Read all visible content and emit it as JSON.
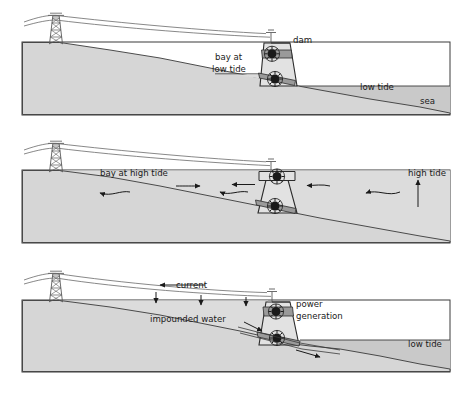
{
  "diagram": {
    "colors": {
      "land": "#d6d6d6",
      "water": "#c9c9c9",
      "bay_water": "#dcdcdc",
      "dam_body": "#e2e2e2",
      "dam_band": "#9a9a9a",
      "turbine_hub": "#1a1a1a",
      "outline": "#2b2b2b",
      "text": "#1a1a1a",
      "background": "#ffffff"
    },
    "panels": [
      {
        "id": "panel-low-tide",
        "index": 1,
        "labels": [
          {
            "name": "dam-label",
            "text": "dam",
            "x": 293,
            "y": 43
          },
          {
            "name": "bay-at-low-tide-label",
            "text": "bay at",
            "x": 215,
            "y": 60
          },
          {
            "name": "bay-at-low-tide-label-line2",
            "text": "low tide",
            "x": 212,
            "y": 72
          },
          {
            "name": "low-tide-label",
            "text": "low tide",
            "x": 360,
            "y": 90
          },
          {
            "name": "sea-label",
            "text": "sea",
            "x": 420,
            "y": 104
          }
        ]
      },
      {
        "id": "panel-high-tide",
        "index": 2,
        "labels": [
          {
            "name": "bay-at-high-tide-label",
            "text": "bay at high tide",
            "x": 100,
            "y": 176
          },
          {
            "name": "high-tide-label",
            "text": "high tide",
            "x": 408,
            "y": 176
          }
        ]
      },
      {
        "id": "panel-power-generation",
        "index": 3,
        "labels": [
          {
            "name": "current-label",
            "text": "current",
            "x": 176,
            "y": 288
          },
          {
            "name": "impounded-water-label",
            "text": "impounded water",
            "x": 150,
            "y": 322
          },
          {
            "name": "power-generation-label",
            "text": "power",
            "x": 296,
            "y": 307
          },
          {
            "name": "power-generation-label-line2",
            "text": "generation",
            "x": 296,
            "y": 319
          },
          {
            "name": "low-tide-label-3",
            "text": "low tide",
            "x": 408,
            "y": 347
          }
        ]
      }
    ]
  }
}
